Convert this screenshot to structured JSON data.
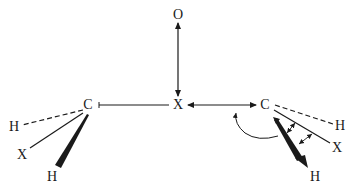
{
  "diagram": {
    "type": "molecular-geometry",
    "colors": {
      "ink": "#1a1a1a",
      "background": "#ffffff"
    },
    "atoms": {
      "oxygen": {
        "label": "O",
        "x": 178,
        "y": 15
      },
      "center_x": {
        "label": "X",
        "x": 178,
        "y": 105
      },
      "left_carbon": {
        "label": "C",
        "x": 88,
        "y": 105
      },
      "right_carbon": {
        "label": "C",
        "x": 265,
        "y": 105
      },
      "left_h_dashed": {
        "label": "H",
        "x": 14,
        "y": 127
      },
      "left_x_plain": {
        "label": "X",
        "x": 22,
        "y": 155
      },
      "left_h_wedge": {
        "label": "H",
        "x": 52,
        "y": 177
      },
      "right_h_dashed": {
        "label": "H",
        "x": 340,
        "y": 126
      },
      "right_x_plain": {
        "label": "X",
        "x": 337,
        "y": 148
      },
      "right_h_wedge": {
        "label": "H",
        "x": 315,
        "y": 177
      }
    },
    "bonds": [
      {
        "id": "o-x",
        "style": "double-headed-arrow",
        "from": "oxygen",
        "to": "center_x"
      },
      {
        "id": "lc-x",
        "style": "plain-line",
        "from": "left_carbon",
        "to": "center_x"
      },
      {
        "id": "x-rc",
        "style": "double-headed-arrow",
        "from": "center_x",
        "to": "right_carbon"
      },
      {
        "id": "lc-h-dash",
        "style": "dashed",
        "from": "left_carbon",
        "to": "left_h_dashed"
      },
      {
        "id": "lc-x-line",
        "style": "plain-line",
        "from": "left_carbon",
        "to": "left_x_plain"
      },
      {
        "id": "lc-h-wedge",
        "style": "wedge",
        "from": "left_carbon",
        "to": "left_h_wedge"
      },
      {
        "id": "rc-h-dash",
        "style": "dashed",
        "from": "right_carbon",
        "to": "right_h_dashed"
      },
      {
        "id": "rc-x-line",
        "style": "plain-line",
        "from": "right_carbon",
        "to": "right_x_plain"
      },
      {
        "id": "rc-h-wedge",
        "style": "wedge-arrow",
        "from": "right_carbon",
        "to": "right_h_wedge"
      }
    ],
    "annotations": [
      {
        "id": "rotation-arrow",
        "style": "curved-arrow",
        "description": "curved arrow indicating rotation near right carbon"
      },
      {
        "id": "angle-arrow-1",
        "style": "small-double-arrow",
        "description": "angle bend between wedge H and X bond"
      },
      {
        "id": "angle-arrow-2",
        "style": "small-double-arrow",
        "description": "angle bend between X bond and wedge H"
      }
    ]
  }
}
